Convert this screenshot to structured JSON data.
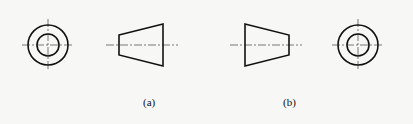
{
  "figure": {
    "background_color": "#f7f7f5",
    "line_color": "#111111",
    "centerline_color": "#222222",
    "panels": [
      {
        "id": "a",
        "label": "(a)",
        "label_pos": {
          "x": 143,
          "y": 96
        },
        "views": [
          {
            "type": "circle-view",
            "cx": 48,
            "cy": 45,
            "outer_r": 20,
            "inner_r": 11,
            "centerline_extent": 26
          },
          {
            "type": "frustum-side-view",
            "orientation": "narrow-left",
            "points": [
              [
                119,
                35
              ],
              [
                163,
                24
              ],
              [
                163,
                66
              ],
              [
                119,
                55
              ]
            ],
            "centerline": {
              "x1": 106,
              "x2": 178,
              "y": 45
            }
          }
        ]
      },
      {
        "id": "b",
        "label": "(b)",
        "label_pos": {
          "x": 283,
          "y": 96
        },
        "views": [
          {
            "type": "frustum-side-view",
            "orientation": "narrow-right",
            "points": [
              [
                245,
                24
              ],
              [
                289,
                35
              ],
              [
                289,
                55
              ],
              [
                245,
                66
              ]
            ],
            "centerline": {
              "x1": 230,
              "x2": 302,
              "y": 45
            }
          },
          {
            "type": "circle-view",
            "cx": 358,
            "cy": 45,
            "outer_r": 20,
            "inner_r": 11,
            "centerline_extent": 26
          }
        ]
      }
    ]
  }
}
